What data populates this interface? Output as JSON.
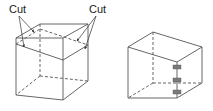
{
  "diagram": {
    "left_figure": {
      "name": "cube-with-cut-lines",
      "labels": [
        "Cut",
        "Cut"
      ]
    },
    "right_figure": {
      "name": "hinged-box",
      "hinge_count": 3
    },
    "colors": {
      "line": "#555555",
      "hinge": "#7a7a7a",
      "background": "#ffffff"
    }
  }
}
